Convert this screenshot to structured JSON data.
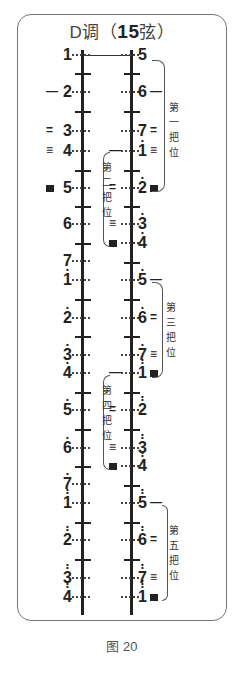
{
  "title": {
    "key": "D调",
    "paren_open": "（",
    "strings": "15",
    "strings_label": "弦",
    "paren_close": "）"
  },
  "caption": "图 20",
  "left_notes": [
    {
      "digit": "1",
      "dots": 0,
      "y": 55,
      "mark": ""
    },
    {
      "digit": "2",
      "dots": 0,
      "y": 92,
      "mark": "一"
    },
    {
      "digit": "3",
      "dots": 0,
      "y": 131,
      "mark": "二"
    },
    {
      "digit": "4",
      "dots": 0,
      "y": 151,
      "mark": "三"
    },
    {
      "digit": "5",
      "dots": 0,
      "y": 188,
      "mark": "四"
    },
    {
      "digit": "6",
      "dots": 0,
      "y": 224,
      "mark": ""
    },
    {
      "digit": "7",
      "dots": 0,
      "y": 261,
      "mark": ""
    },
    {
      "digit": "1",
      "dots": 1,
      "y": 280,
      "mark": ""
    },
    {
      "digit": "2",
      "dots": 1,
      "y": 318,
      "mark": ""
    },
    {
      "digit": "3",
      "dots": 1,
      "y": 355,
      "mark": ""
    },
    {
      "digit": "4",
      "dots": 1,
      "y": 373,
      "mark": ""
    },
    {
      "digit": "5",
      "dots": 1,
      "y": 410,
      "mark": ""
    },
    {
      "digit": "6",
      "dots": 1,
      "y": 448,
      "mark": ""
    },
    {
      "digit": "7",
      "dots": 1,
      "y": 484,
      "mark": ""
    },
    {
      "digit": "1",
      "dots": 2,
      "y": 503,
      "mark": ""
    },
    {
      "digit": "2",
      "dots": 2,
      "y": 540,
      "mark": ""
    },
    {
      "digit": "3",
      "dots": 2,
      "y": 578,
      "mark": ""
    },
    {
      "digit": "4",
      "dots": 2,
      "y": 597,
      "mark": ""
    }
  ],
  "right_notes": [
    {
      "digit": "5",
      "dots": 0,
      "y": 55,
      "mark_left": "",
      "mark_right": ""
    },
    {
      "digit": "6",
      "dots": 0,
      "y": 92,
      "mark_left": "",
      "mark_right": "一"
    },
    {
      "digit": "7",
      "dots": 0,
      "y": 131,
      "mark_left": "",
      "mark_right": "二"
    },
    {
      "digit": "1",
      "dots": 1,
      "y": 151,
      "mark_left": "一",
      "mark_right": "三"
    },
    {
      "digit": "2",
      "dots": 1,
      "y": 188,
      "mark_left": "二",
      "mark_right": "四"
    },
    {
      "digit": "3",
      "dots": 1,
      "y": 224,
      "mark_left": "三",
      "mark_right": ""
    },
    {
      "digit": "4",
      "dots": 1,
      "y": 243,
      "mark_left": "四",
      "mark_right": ""
    },
    {
      "digit": "5",
      "dots": 1,
      "y": 280,
      "mark_left": "",
      "mark_right": "一"
    },
    {
      "digit": "6",
      "dots": 1,
      "y": 318,
      "mark_left": "",
      "mark_right": "二"
    },
    {
      "digit": "7",
      "dots": 1,
      "y": 355,
      "mark_left": "",
      "mark_right": "三"
    },
    {
      "digit": "1",
      "dots": 2,
      "y": 373,
      "mark_left": "一",
      "mark_right": "四"
    },
    {
      "digit": "2",
      "dots": 2,
      "y": 410,
      "mark_left": "二",
      "mark_right": ""
    },
    {
      "digit": "3",
      "dots": 2,
      "y": 448,
      "mark_left": "三",
      "mark_right": ""
    },
    {
      "digit": "4",
      "dots": 2,
      "y": 466,
      "mark_left": "四",
      "mark_right": ""
    },
    {
      "digit": "5",
      "dots": 2,
      "y": 503,
      "mark_left": "",
      "mark_right": "一"
    },
    {
      "digit": "6",
      "dots": 2,
      "y": 540,
      "mark_left": "",
      "mark_right": "二"
    },
    {
      "digit": "7",
      "dots": 2,
      "y": 578,
      "mark_left": "",
      "mark_right": "三"
    },
    {
      "digit": "1",
      "dots": 3,
      "y": 597,
      "mark_left": "",
      "mark_right": "四"
    }
  ],
  "positions": [
    {
      "label": [
        "第",
        "一",
        "把",
        "位"
      ],
      "side": "right"
    },
    {
      "label": [
        "第",
        "二",
        "把",
        "位"
      ],
      "side": "left"
    },
    {
      "label": [
        "第",
        "三",
        "把",
        "位"
      ],
      "side": "right"
    },
    {
      "label": [
        "第",
        "四",
        "把",
        "位"
      ],
      "side": "left"
    },
    {
      "label": [
        "第",
        "五",
        "把",
        "位"
      ],
      "side": "right"
    }
  ]
}
